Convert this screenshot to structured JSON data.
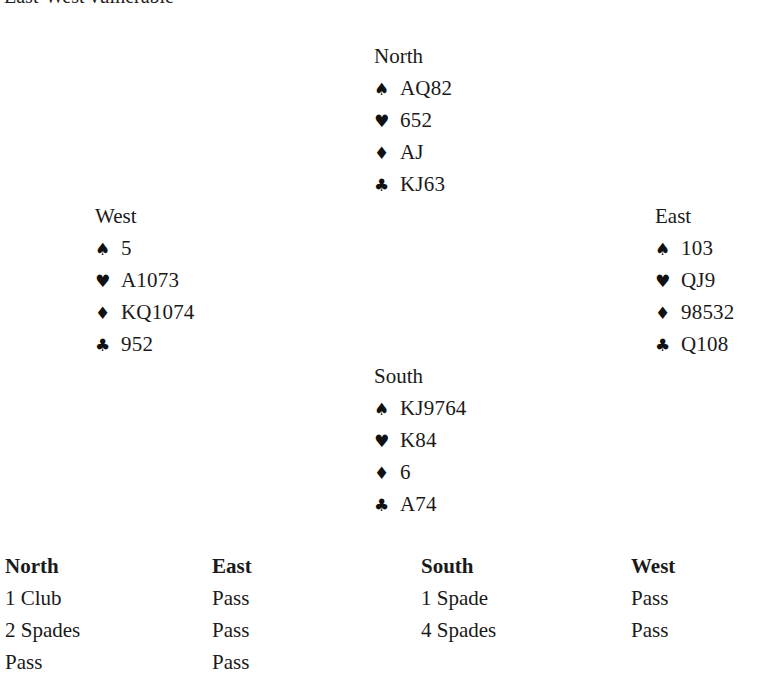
{
  "caption": "East-West vulnerable",
  "suit_icons": {
    "spades": "♠",
    "hearts": "♥",
    "diamonds": "♦",
    "clubs": "♣"
  },
  "hands": {
    "north": {
      "seat": "North",
      "spades": "AQ82",
      "hearts": "652",
      "diamonds": "AJ",
      "clubs": "KJ63"
    },
    "west": {
      "seat": "West",
      "spades": "5",
      "hearts": "A1073",
      "diamonds": "KQ1074",
      "clubs": "952"
    },
    "east": {
      "seat": "East",
      "spades": "103",
      "hearts": "QJ9",
      "diamonds": "98532",
      "clubs": "Q108"
    },
    "south": {
      "seat": "South",
      "spades": "KJ9764",
      "hearts": "K84",
      "diamonds": "6",
      "clubs": "A74"
    }
  },
  "auction": {
    "headers": [
      "North",
      "East",
      "South",
      "West"
    ],
    "columns": [
      [
        "1 Club",
        "2 Spades",
        "Pass"
      ],
      [
        "Pass",
        "Pass",
        "Pass"
      ],
      [
        "1 Spade",
        "4 Spades"
      ],
      [
        "Pass",
        "Pass"
      ]
    ]
  }
}
